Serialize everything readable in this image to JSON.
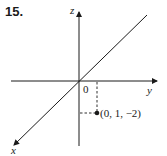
{
  "problem": {
    "number": "15."
  },
  "axes": {
    "x_label": "x",
    "y_label": "y",
    "z_label": "z",
    "origin_label": "0"
  },
  "point": {
    "label": "(0, 1, −2)",
    "coords": [
      0,
      1,
      -2
    ]
  },
  "colors": {
    "ink": "#1a1a1a",
    "background": "#ffffff"
  }
}
